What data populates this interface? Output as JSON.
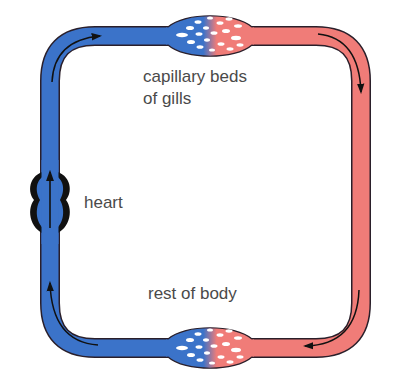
{
  "diagram": {
    "labels": {
      "gills_line1": "capillary beds",
      "gills_line2": "of gills",
      "heart": "heart",
      "body": "rest of body"
    },
    "colors": {
      "deoxygenated": "#3b73c9",
      "oxygenated": "#f07c78",
      "outline": "#2a1f2a",
      "heart_outline": "#111111",
      "capillary_hole": "#ffffff",
      "text": "#4a4a4a"
    },
    "flow_arrows": [
      "top-left: rightward",
      "top-right corner: downward",
      "bottom-right corner: leftward",
      "bottom-left corner: upward",
      "heart: upward"
    ]
  }
}
